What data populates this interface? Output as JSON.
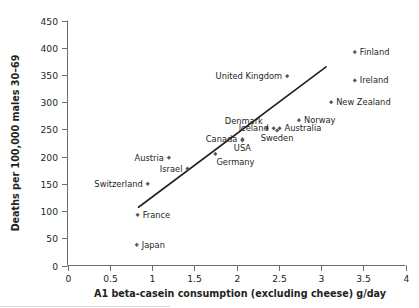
{
  "chart_data": {
    "type": "scatter",
    "title": "",
    "xlabel": "A1 beta-casein consumption (excluding cheese) g/day",
    "ylabel": "Deaths per 100,000 males 30–69",
    "xlim": [
      0,
      4
    ],
    "ylim": [
      0,
      450
    ],
    "xticks": [
      "0",
      "0.5",
      "1",
      "1.5",
      "2",
      "2.5",
      "3",
      "3.5",
      "4"
    ],
    "xtick_values": [
      0,
      0.5,
      1,
      1.5,
      2,
      2.5,
      3,
      3.5,
      4
    ],
    "yticks": [
      "0",
      "50",
      "100",
      "150",
      "200",
      "250",
      "300",
      "350",
      "400",
      "450"
    ],
    "ytick_values": [
      0,
      50,
      100,
      150,
      200,
      250,
      300,
      350,
      400,
      450
    ],
    "grid": false,
    "legend": "none",
    "marker_style": "small-diamond",
    "points": [
      {
        "label": "Finland",
        "x": 3.4,
        "y": 392,
        "label_side": "right"
      },
      {
        "label": "Ireland",
        "x": 3.4,
        "y": 340,
        "label_side": "right"
      },
      {
        "label": "New Zealand",
        "x": 3.12,
        "y": 300,
        "label_side": "right"
      },
      {
        "label": "United Kingdom",
        "x": 2.6,
        "y": 348,
        "label_side": "left"
      },
      {
        "label": "Norway",
        "x": 2.74,
        "y": 267,
        "label_side": "right"
      },
      {
        "label": "Australia",
        "x": 2.51,
        "y": 252,
        "label_side": "right"
      },
      {
        "label": "Sweden",
        "x": 2.48,
        "y": 248,
        "label_side": "below"
      },
      {
        "label": "Denmark",
        "x": 2.36,
        "y": 252,
        "label_side": "above-left"
      },
      {
        "label": "Iceland",
        "x": 2.44,
        "y": 252,
        "label_side": "left"
      },
      {
        "label": "USA",
        "x": 2.07,
        "y": 230,
        "label_side": "below"
      },
      {
        "label": "Canada",
        "x": 2.07,
        "y": 232,
        "label_side": "left"
      },
      {
        "label": "Germany",
        "x": 1.75,
        "y": 205,
        "label_side": "below-right"
      },
      {
        "label": "Austria",
        "x": 1.2,
        "y": 198,
        "label_side": "left"
      },
      {
        "label": "Israel",
        "x": 1.42,
        "y": 178,
        "label_side": "left"
      },
      {
        "label": "Switzerland",
        "x": 0.95,
        "y": 150,
        "label_side": "left"
      },
      {
        "label": "France",
        "x": 0.83,
        "y": 93,
        "label_side": "right"
      },
      {
        "label": "Japan",
        "x": 0.82,
        "y": 38,
        "label_side": "right"
      }
    ],
    "trendline": {
      "type": "linear-fit",
      "x_start": 0.84,
      "y_start": 107,
      "x_end": 3.06,
      "y_end": 365
    }
  },
  "colors": {
    "marker": "#58595b",
    "trendline": "#231f20",
    "axis": "#6d6e71",
    "text": "#231f20",
    "background": "#ffffff"
  }
}
